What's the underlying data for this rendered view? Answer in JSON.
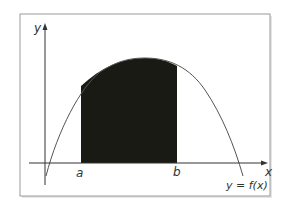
{
  "diagram": {
    "axes": {
      "x_label": "x",
      "y_label": "y"
    },
    "bounds": {
      "a_label": "a",
      "b_label": "b"
    },
    "curve_label": "y = f(x)",
    "colors": {
      "frame": "#9a9a9a",
      "axis": "#333333",
      "curve": "#555555",
      "shaded_region": "#1a1a14",
      "text": "#333333"
    }
  }
}
